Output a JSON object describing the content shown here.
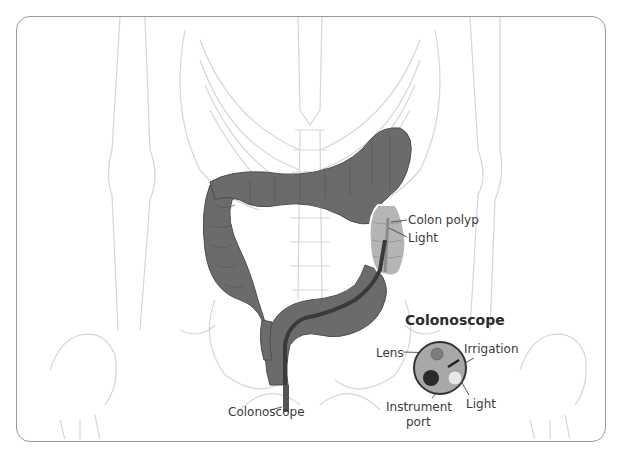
{
  "diagram": {
    "title": "Colonoscope",
    "labels": {
      "colon_polyp": "Colon polyp",
      "light_in_colon": "Light",
      "colonoscope": "Colonoscope",
      "lens": "Lens",
      "irrigation": "Irrigation",
      "instrument_port": "Instrument",
      "instrument_port_line2": "port",
      "light_tip": "Light"
    },
    "colors": {
      "colon": "#6b6b6b",
      "colon_dark": "#4a4a4a",
      "skeleton": "#e4e4e4",
      "skeleton_line": "#cfcfcf",
      "scope_tip_fill": "#a8a8a8",
      "lens": "#7d7d7d",
      "port": "#2a2a2a",
      "light": "#e8e8e8",
      "frame_border": "#9a9a9a"
    }
  }
}
